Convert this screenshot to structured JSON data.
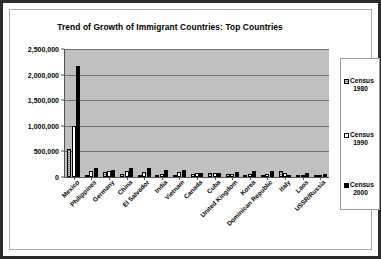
{
  "chart_data": {
    "type": "bar",
    "title": "Trend of Growth of Immigrant Countries:  Top Countries",
    "xlabel": "",
    "ylabel": "",
    "ylim": [
      0,
      2500000
    ],
    "ytick_labels": [
      "2,500,000",
      "2,000,000",
      "1,500,000",
      "1,000,000",
      "500,000",
      "0"
    ],
    "ytick_values": [
      2500000,
      2000000,
      1500000,
      1000000,
      500000,
      0
    ],
    "grid": true,
    "legend_position": "right",
    "plot_background": "#c0c0c0",
    "categories": [
      "Mexico",
      "Philippines",
      "Germany",
      "China",
      "El Salvador",
      "India",
      "Vietnam",
      "Canada",
      "Cuba",
      "United Kingdom",
      "Korea",
      "Dominican Republic",
      "Italy",
      "Laos",
      "USSR/Russia"
    ],
    "series": [
      {
        "name": "Census 1980",
        "color": "#808080",
        "values": [
          550000,
          30000,
          95000,
          55000,
          15000,
          20000,
          15000,
          60000,
          70000,
          65000,
          40000,
          45000,
          120000,
          15000,
          30000
        ]
      },
      {
        "name": "Census 1990",
        "color": "#ffffff",
        "values": [
          1000000,
          110000,
          125000,
          110000,
          100000,
          55000,
          105000,
          70000,
          75000,
          65000,
          60000,
          60000,
          85000,
          30000,
          25000
        ]
      },
      {
        "name": "Census 2000",
        "color": "#000000",
        "values": [
          2170000,
          185000,
          135000,
          175000,
          185000,
          140000,
          145000,
          80000,
          80000,
          95000,
          110000,
          110000,
          45000,
          75000,
          65000
        ]
      }
    ]
  },
  "legend": {
    "entries": [
      {
        "label_line1": "Census",
        "label_line2": "1980",
        "swatch": "s1980"
      },
      {
        "label_line1": "Census",
        "label_line2": "1990",
        "swatch": "s1990"
      },
      {
        "label_line1": "Census",
        "label_line2": "2000",
        "swatch": "s2000"
      }
    ]
  }
}
